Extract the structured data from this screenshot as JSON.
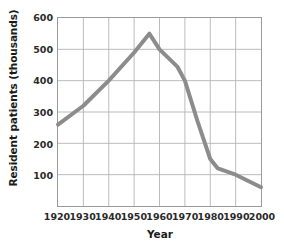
{
  "chart_data": {
    "type": "line",
    "title": "",
    "xlabel": "Year",
    "ylabel": "Resident patients (thousands)",
    "xlim": [
      1920,
      2000
    ],
    "ylim": [
      0,
      600
    ],
    "grid": true,
    "legend": "none",
    "xticks": [
      1920,
      1930,
      1940,
      1950,
      1960,
      1970,
      1980,
      1990,
      2000
    ],
    "xtick_labels": [
      "1920",
      "1930",
      "1940",
      "1950",
      "1960",
      "1970",
      "1980",
      "1990",
      "2000"
    ],
    "yticks": [
      100,
      200,
      300,
      400,
      500,
      600
    ],
    "ytick_labels": [
      "100",
      "200",
      "300",
      "400",
      "500",
      "600"
    ],
    "series": [
      {
        "name": "Resident patients",
        "color": "#8c8c8c",
        "x": [
          1920,
          1930,
          1940,
          1950,
          1956,
          1960,
          1967,
          1970,
          1975,
          1980,
          1983,
          1990,
          2000
        ],
        "values": [
          260,
          320,
          400,
          490,
          550,
          500,
          445,
          400,
          270,
          150,
          120,
          100,
          60
        ]
      }
    ],
    "colors": {
      "line": "#8c8c8c",
      "grid": "#b4b4b4",
      "axis": "#8a8a8a",
      "text": "#1b1b1b",
      "background": "#ffffff"
    }
  }
}
